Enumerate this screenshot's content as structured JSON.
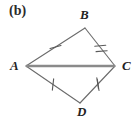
{
  "figure": {
    "caption": "(b)",
    "shape_name": "kite-ABCD",
    "background_color": "#ffffff",
    "edge_color": "#6b6b6b",
    "diagonal_color": "#8a8a8a",
    "tick_color": "#5a5a5a",
    "label_color": "#232323"
  },
  "vertices": [
    {
      "id": "A",
      "label": "A",
      "x": 26,
      "y": 66,
      "label_x": 10,
      "label_y": 59
    },
    {
      "id": "B",
      "label": "B",
      "x": 85,
      "y": 28,
      "label_x": 80,
      "label_y": 8
    },
    {
      "id": "C",
      "label": "C",
      "x": 115,
      "y": 66,
      "label_x": 122,
      "label_y": 59
    },
    {
      "id": "D",
      "label": "D",
      "x": 80,
      "y": 103,
      "label_x": 77,
      "label_y": 105
    }
  ],
  "edges": [
    {
      "id": "AB",
      "from": "A",
      "to": "B",
      "tick_marks": 1,
      "style": "thin",
      "x1": 26,
      "y1": 66,
      "x2": 85,
      "y2": 28
    },
    {
      "id": "BC",
      "from": "B",
      "to": "C",
      "tick_marks": 2,
      "style": "thin",
      "x1": 85,
      "y1": 28,
      "x2": 115,
      "y2": 66
    },
    {
      "id": "CD",
      "from": "C",
      "to": "D",
      "tick_marks": 2,
      "style": "thin",
      "x1": 115,
      "y1": 66,
      "x2": 80,
      "y2": 103
    },
    {
      "id": "DA",
      "from": "D",
      "to": "A",
      "tick_marks": 1,
      "style": "thin",
      "x1": 80,
      "y1": 103,
      "x2": 26,
      "y2": 66
    },
    {
      "id": "AC",
      "from": "A",
      "to": "C",
      "tick_marks": 0,
      "style": "thick",
      "x1": 26,
      "y1": 66,
      "x2": 115,
      "y2": 66
    }
  ],
  "congruence_groups": [
    {
      "ticks": 1,
      "edges": [
        "AB",
        "DA"
      ]
    },
    {
      "ticks": 2,
      "edges": [
        "BC",
        "CD"
      ]
    }
  ]
}
